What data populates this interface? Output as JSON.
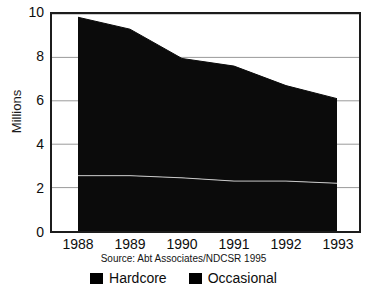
{
  "chart_data": {
    "type": "area",
    "stacked": true,
    "title": "",
    "xlabel": "",
    "ylabel": "Millions",
    "categories": [
      "1988",
      "1989",
      "1990",
      "1991",
      "1992",
      "1993"
    ],
    "x": [
      1988,
      1989,
      1990,
      1991,
      1992,
      1993
    ],
    "xlim": [
      1988,
      1993
    ],
    "ylim": [
      0,
      10
    ],
    "yticks": [
      0,
      2,
      4,
      6,
      8,
      10
    ],
    "ytick_labels": [
      "0",
      "2",
      "4",
      "6",
      "8",
      "10"
    ],
    "grid": "horizontal",
    "legend_position": "bottom",
    "series": [
      {
        "name": "Occasional",
        "values": [
          2.55,
          2.55,
          2.45,
          2.3,
          2.3,
          2.2
        ],
        "color": "#000000"
      },
      {
        "name": "Hardcore",
        "values": [
          7.3,
          6.75,
          5.5,
          5.3,
          4.4,
          3.9
        ],
        "color": "#000000"
      }
    ],
    "totals": [
      9.85,
      9.3,
      7.95,
      7.6,
      6.7,
      6.1
    ],
    "annotations": [
      "Source: Abt Associates/NDCSR 1995"
    ]
  },
  "axes": {
    "y_title": "Millions",
    "y_tick_labels": [
      "10",
      "8",
      "6",
      "4",
      "2",
      "0"
    ],
    "x_tick_labels": [
      "1988",
      "1989",
      "1990",
      "1991",
      "1992",
      "1993"
    ]
  },
  "source": {
    "text": "Source: Abt Associates/NDCSR 1995"
  },
  "legend": {
    "items": [
      {
        "label": "Hardcore",
        "color": "#000000"
      },
      {
        "label": "Occasional",
        "color": "#000000"
      }
    ]
  },
  "colors": {
    "area_fill": "#0b0b0b",
    "axis": "#1c1c1c",
    "grid": "#9a9a9a",
    "background": "#ffffff",
    "text": "#0d0d0d"
  }
}
